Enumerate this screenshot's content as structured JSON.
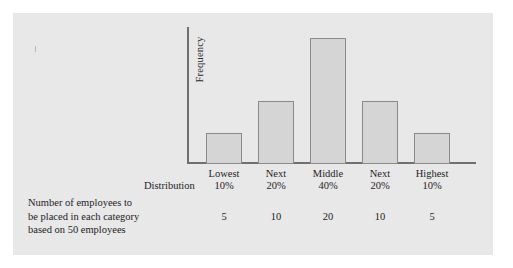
{
  "chart_data": {
    "type": "bar",
    "title": "",
    "xlabel": "Distribution",
    "ylabel": "Frequency",
    "categories": [
      "Lowest 10%",
      "Next 20%",
      "Middle 40%",
      "Next 20%",
      "Highest 10%"
    ],
    "category_lines": [
      {
        "name": "Lowest",
        "percent": "10%"
      },
      {
        "name": "Next",
        "percent": "20%"
      },
      {
        "name": "Middle",
        "percent": "40%"
      },
      {
        "name": "Next",
        "percent": "20%"
      },
      {
        "name": "Highest",
        "percent": "10%"
      }
    ],
    "values": [
      5,
      10,
      20,
      10,
      5
    ],
    "value_labels": [
      "5",
      "10",
      "20",
      "10",
      "5"
    ],
    "ylim": [
      0,
      22
    ],
    "grid": false,
    "legend": "none",
    "bar_fill": "#d5d5d5",
    "bar_outline": "#8a8a8a",
    "axis_color": "#6f6f6f",
    "panel_background": "#e8e8e8",
    "value_row_title": "Number of employees to be placed in each category based on 50 employees"
  },
  "axis": {
    "y_title": "Frequency",
    "x_title": "Distribution"
  },
  "caption": {
    "line1": "Number of employees to",
    "line2": "be placed in each category",
    "line3": "based on 50 employees"
  }
}
